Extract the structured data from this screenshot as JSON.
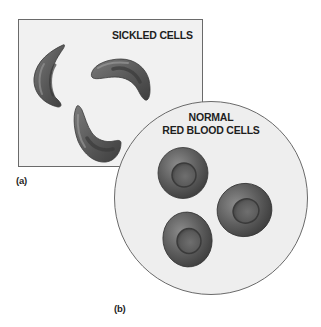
{
  "figure": {
    "panel_a": {
      "label": "(a)",
      "title": "SICKLED CELLS",
      "cell_count": 3,
      "cell_shape": "sickle"
    },
    "panel_b": {
      "label": "(b)",
      "title_line1": "NORMAL",
      "title_line2": "RED BLOOD CELLS",
      "cell_count": 3,
      "cell_shape": "biconcave-disc"
    },
    "colors": {
      "background": "#ffffff",
      "panel_fill": "#f0f0f0",
      "panel_border": "#6a6a6a",
      "cell_body": "#5c5c5c",
      "cell_highlight": "#9a9a9a",
      "cell_shadow": "#3a3a3a",
      "text": "#1e1e1e"
    }
  }
}
